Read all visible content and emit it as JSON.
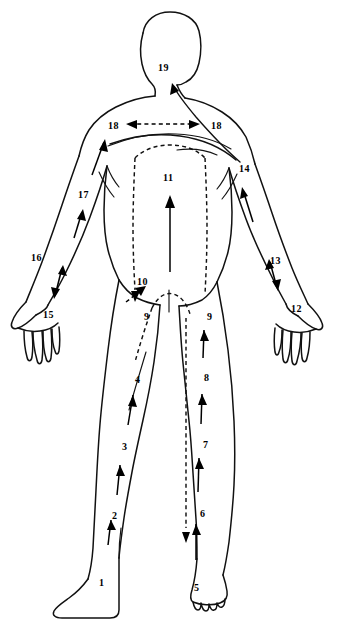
{
  "figure": {
    "view": "posterior",
    "background_color": "#ffffff",
    "ink_color": "#000000",
    "width": 341,
    "height": 628
  },
  "labels": [
    {
      "id": "label-1",
      "text": "1",
      "x": 99,
      "y": 578,
      "region": "left-foot"
    },
    {
      "id": "label-2",
      "text": "2",
      "x": 112,
      "y": 511,
      "region": "left-lower-leg"
    },
    {
      "id": "label-3",
      "text": "3",
      "x": 122,
      "y": 442,
      "region": "left-knee"
    },
    {
      "id": "label-4",
      "text": "4",
      "x": 135,
      "y": 375,
      "region": "left-thigh"
    },
    {
      "id": "label-5",
      "text": "5",
      "x": 194,
      "y": 583,
      "region": "right-foot"
    },
    {
      "id": "label-6",
      "text": "6",
      "x": 200,
      "y": 509,
      "region": "right-lower-leg"
    },
    {
      "id": "label-7",
      "text": "7",
      "x": 203,
      "y": 440,
      "region": "right-knee"
    },
    {
      "id": "label-8",
      "text": "8",
      "x": 204,
      "y": 373,
      "region": "right-thigh"
    },
    {
      "id": "label-9a",
      "text": "9",
      "x": 144,
      "y": 312,
      "region": "left-inguinal"
    },
    {
      "id": "label-9b",
      "text": "9",
      "x": 207,
      "y": 312,
      "region": "right-inguinal"
    },
    {
      "id": "label-10",
      "text": "10",
      "x": 137,
      "y": 277,
      "region": "lower-abdomen"
    },
    {
      "id": "label-11",
      "text": "11",
      "x": 163,
      "y": 173,
      "region": "mid-back"
    },
    {
      "id": "label-12",
      "text": "12",
      "x": 291,
      "y": 304,
      "region": "right-wrist"
    },
    {
      "id": "label-13",
      "text": "13",
      "x": 270,
      "y": 256,
      "region": "right-forearm"
    },
    {
      "id": "label-14",
      "text": "14",
      "x": 239,
      "y": 164,
      "region": "right-axilla"
    },
    {
      "id": "label-15",
      "text": "15",
      "x": 43,
      "y": 310,
      "region": "left-wrist"
    },
    {
      "id": "label-16",
      "text": "16",
      "x": 31,
      "y": 253,
      "region": "left-forearm"
    },
    {
      "id": "label-17",
      "text": "17",
      "x": 78,
      "y": 190,
      "region": "left-upper-arm"
    },
    {
      "id": "label-18a",
      "text": "18",
      "x": 108,
      "y": 121,
      "region": "left-scapular"
    },
    {
      "id": "label-18b",
      "text": "18",
      "x": 211,
      "y": 121,
      "region": "right-scapular"
    },
    {
      "id": "label-19",
      "text": "19",
      "x": 158,
      "y": 63,
      "region": "neck-occipital"
    }
  ],
  "legend_notes": {
    "solid_arrow": "superficial lymph flow direction",
    "dashed_arrow": "deep lymph flow direction",
    "dashed_outline": "watershed / drainage territory boundary"
  }
}
